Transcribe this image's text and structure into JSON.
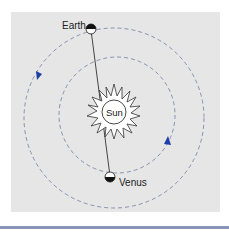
{
  "figure": {
    "labels": {
      "earth": "Earth",
      "venus": "Venus",
      "sun": "Sun"
    },
    "colors": {
      "panel_background": "#e6e6e6",
      "orbit_stroke": "#7f86a6",
      "direction_arrow": "#1f3fa8",
      "bottom_rule": "#8a93b8"
    },
    "geometry": {
      "sun_center": [
        114,
        112
      ],
      "outer_orbit_radius": 90,
      "inner_orbit_radius": 58,
      "earth_position": [
        91,
        28
      ],
      "venus_position": [
        110,
        176
      ]
    }
  }
}
